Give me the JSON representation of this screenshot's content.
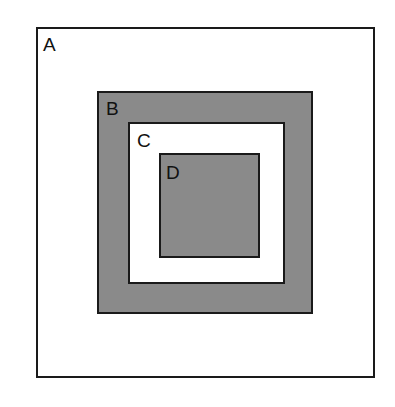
{
  "diagram": {
    "type": "nested-squares",
    "boxes": [
      {
        "label": "A",
        "fill": "#ffffff"
      },
      {
        "label": "B",
        "fill": "#8a8a8a"
      },
      {
        "label": "C",
        "fill": "#ffffff"
      },
      {
        "label": "D",
        "fill": "#8a8a8a"
      }
    ]
  }
}
